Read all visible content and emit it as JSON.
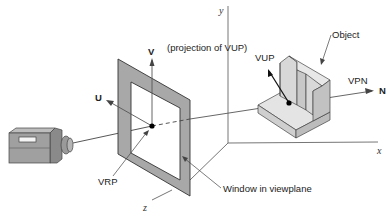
{
  "figure": {
    "labels": {
      "y_axis": "y",
      "x_axis": "x",
      "z_axis": "z",
      "v_axis": "V",
      "u_axis": "U",
      "n_axis": "N",
      "projection_of_vup": "(projection of VUP)",
      "vup": "VUP",
      "vpn": "VPN",
      "object": "Object",
      "vrp": "VRP",
      "window": "Window in viewplane"
    },
    "colors": {
      "frame_fill": "#a8a8a8",
      "object_light": "#e2e2e2",
      "object_mid": "#cfcfcf",
      "camera_body": "#9a9a9a",
      "line": "#444444"
    }
  }
}
